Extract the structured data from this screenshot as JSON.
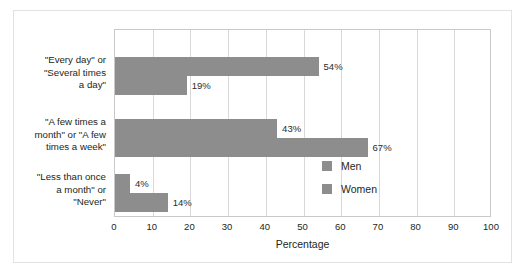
{
  "chart_data": {
    "type": "bar",
    "orientation": "horizontal",
    "title": "",
    "xlabel": "Percentage",
    "ylabel": "",
    "xlim": [
      0,
      100
    ],
    "xticks": [
      0,
      10,
      20,
      30,
      40,
      50,
      60,
      70,
      80,
      90,
      100
    ],
    "xtick_labels": [
      "0",
      "10",
      "20",
      "30",
      "40",
      "50",
      "60",
      "70",
      "80",
      "90",
      "100"
    ],
    "grid": "vertical",
    "legend_position": "inside-right",
    "bar_color": "#8d8d8d",
    "categories": [
      "\"Every day\" or\n\"Several times\na day\"",
      "\"A few times a\nmonth\" or \"A few\ntimes a week\"",
      "\"Less than once\na month\" or\n\"Never\""
    ],
    "series": [
      {
        "name": "Men",
        "values": [
          54,
          43,
          4
        ],
        "value_labels": [
          "54%",
          "43%",
          "4%"
        ],
        "color": "#8d8d8d"
      },
      {
        "name": "Women",
        "values": [
          19,
          67,
          14
        ],
        "value_labels": [
          "19%",
          "67%",
          "14%"
        ],
        "color": "#8d8d8d"
      }
    ]
  },
  "legend": {
    "items": [
      {
        "label": "Men"
      },
      {
        "label": "Women"
      }
    ]
  }
}
